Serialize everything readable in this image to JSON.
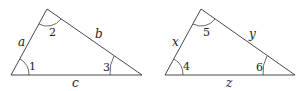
{
  "triangles": [
    {
      "id": "left",
      "sides": {
        "left": "a",
        "right": "b",
        "bottom": "c"
      },
      "angles": {
        "bottom_left": "1",
        "top": "2",
        "bottom_right": "3"
      }
    },
    {
      "id": "right",
      "sides": {
        "left": "x",
        "right": "y",
        "bottom": "z"
      },
      "angles": {
        "bottom_left": "4",
        "top": "5",
        "bottom_right": "6"
      }
    }
  ]
}
